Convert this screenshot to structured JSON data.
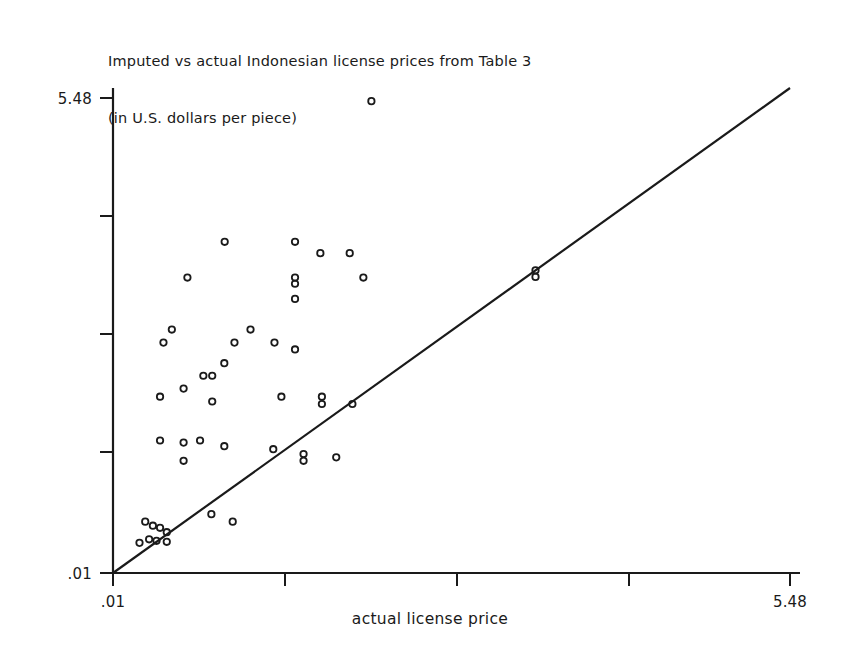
{
  "chart_data": {
    "type": "scatter",
    "title": "Imputed vs actual Indonesian license prices from Table 3",
    "subtitle": "(in U.S. dollars per piece)",
    "xlabel": "actual license price",
    "ylabel": "",
    "xlim": [
      0.01,
      5.48
    ],
    "ylim": [
      0.01,
      5.48
    ],
    "scale": "log",
    "grid": false,
    "legend": null,
    "x_tick_labels": [
      ".01",
      "5.48"
    ],
    "y_tick_labels": [
      ".01",
      "5.48"
    ],
    "x_tick_values": [
      0.01,
      5.48
    ],
    "y_tick_values": [
      0.01,
      5.48
    ],
    "x_tick_count": 5,
    "y_tick_count": 5,
    "annotations": [
      {
        "name": "identity-line",
        "description": "45 degree reference line y = x",
        "from": [
          0.01,
          0.01
        ],
        "to": [
          5.48,
          5.48
        ]
      }
    ],
    "marker_style": "open-circle",
    "points": [
      [
        0.111,
        4.62
      ],
      [
        0.0283,
        0.742
      ],
      [
        0.0545,
        0.742
      ],
      [
        0.069,
        0.64
      ],
      [
        0.0907,
        0.64
      ],
      [
        0.02,
        0.466
      ],
      [
        0.0545,
        0.466
      ],
      [
        0.0545,
        0.43
      ],
      [
        0.103,
        0.466
      ],
      [
        0.0545,
        0.353
      ],
      [
        0.0173,
        0.237
      ],
      [
        0.036,
        0.237
      ],
      [
        0.016,
        0.2
      ],
      [
        0.031,
        0.2
      ],
      [
        0.045,
        0.2
      ],
      [
        0.0545,
        0.183
      ],
      [
        0.0282,
        0.153
      ],
      [
        0.0232,
        0.13
      ],
      [
        0.0252,
        0.13
      ],
      [
        0.0193,
        0.11
      ],
      [
        0.0155,
        0.099
      ],
      [
        0.0252,
        0.093
      ],
      [
        0.048,
        0.099
      ],
      [
        0.07,
        0.099
      ],
      [
        0.07,
        0.09
      ],
      [
        0.093,
        0.09
      ],
      [
        0.0155,
        0.056
      ],
      [
        0.0193,
        0.0545
      ],
      [
        0.0225,
        0.056
      ],
      [
        0.0282,
        0.052
      ],
      [
        0.0193,
        0.043
      ],
      [
        0.0445,
        0.05
      ],
      [
        0.059,
        0.047
      ],
      [
        0.059,
        0.043
      ],
      [
        0.08,
        0.045
      ],
      [
        0.0135,
        0.0195
      ],
      [
        0.0145,
        0.0185
      ],
      [
        0.0155,
        0.018
      ],
      [
        0.0165,
        0.017
      ],
      [
        0.014,
        0.0155
      ],
      [
        0.015,
        0.0152
      ],
      [
        0.0165,
        0.015
      ],
      [
        0.0128,
        0.0148
      ],
      [
        0.025,
        0.0215
      ],
      [
        0.0305,
        0.0195
      ],
      [
        0.512,
        0.512
      ],
      [
        0.512,
        0.47
      ]
    ]
  }
}
